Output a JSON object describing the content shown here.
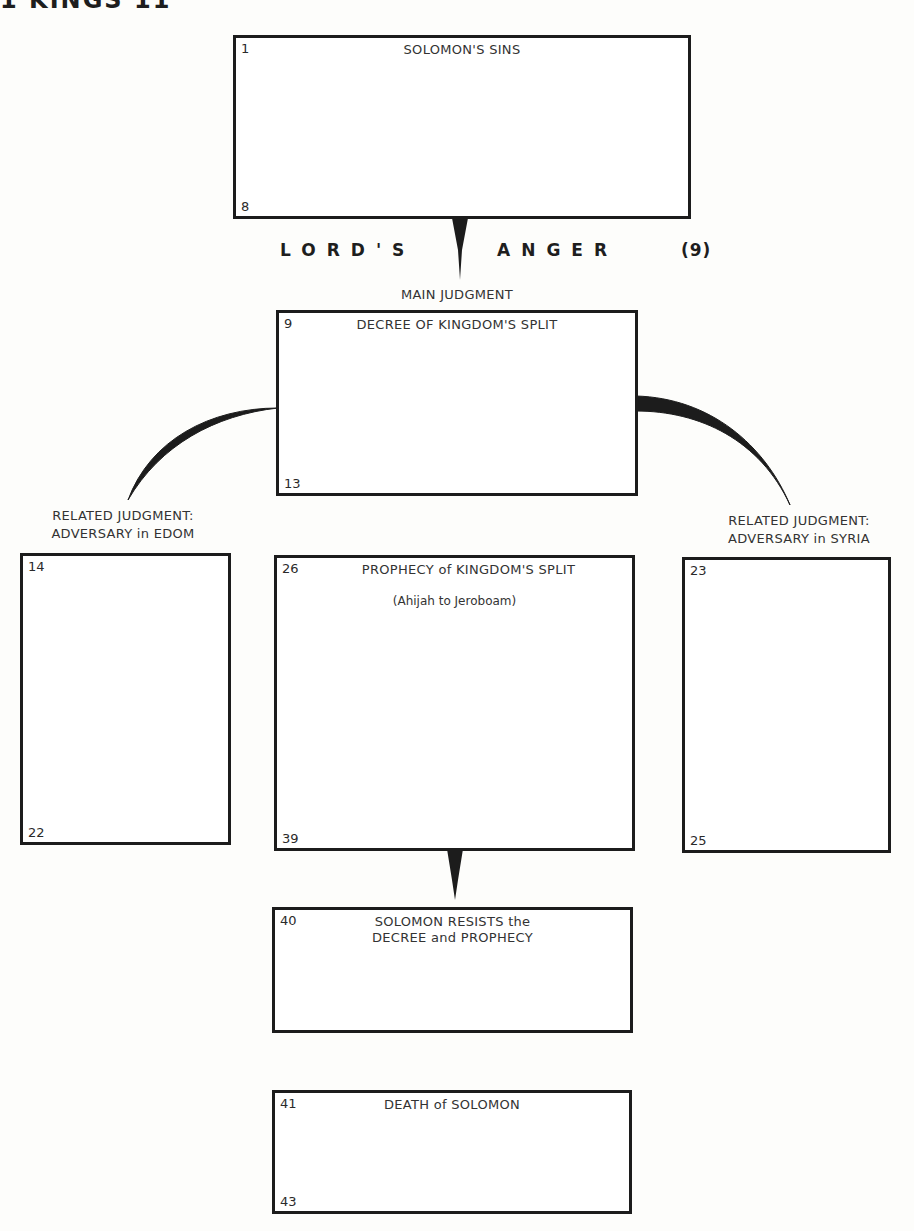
{
  "page": {
    "title": "1 KINGS 11"
  },
  "connector_text": {
    "left_word": "LORD'S",
    "right_word": "ANGER",
    "verse_ref": "(9)"
  },
  "labels": {
    "main": "MAIN JUDGMENT",
    "left_line1": "RELATED JUDGMENT:",
    "left_line2": "ADVERSARY in EDOM",
    "right_line1": "RELATED JUDGMENT:",
    "right_line2": "ADVERSARY in SYRIA"
  },
  "boxes": {
    "sins": {
      "start": "1",
      "end": "8",
      "title": "SOLOMON'S SINS"
    },
    "decree": {
      "start": "9",
      "end": "13",
      "title": "DECREE OF KINGDOM'S SPLIT"
    },
    "edom": {
      "start": "14",
      "end": "22"
    },
    "prophecy": {
      "start": "26",
      "end": "39",
      "title": "PROPHECY of KINGDOM'S SPLIT",
      "subtitle": "(Ahijah to Jeroboam)"
    },
    "syria": {
      "start": "23",
      "end": "25"
    },
    "resists": {
      "start": "40",
      "title_line1": "SOLOMON RESISTS the",
      "title_line2": "DECREE and PROPHECY"
    },
    "death": {
      "start": "41",
      "end": "43",
      "title": "DEATH of SOLOMON"
    }
  },
  "colors": {
    "ink": "#1c1c1c",
    "paper": "#fdfdfb"
  }
}
